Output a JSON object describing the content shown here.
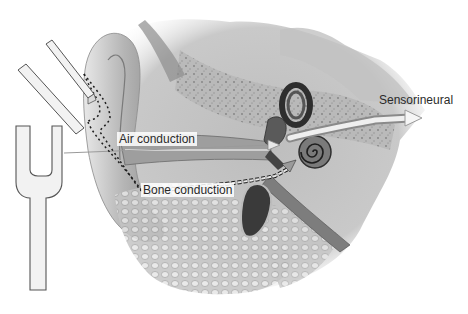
{
  "diagram": {
    "labels": {
      "air": "Air conduction",
      "bone": "Bone conduction",
      "sensorineural": "Sensorineural"
    },
    "elements": [
      {
        "name": "tuning-fork-angled",
        "description": "tuning fork prongs held near ear canal"
      },
      {
        "name": "tuning-fork-upright",
        "description": "tuning fork held vertically, arrow toward ear"
      },
      {
        "name": "outer-ear",
        "description": "auricle / pinna"
      },
      {
        "name": "ear-canal",
        "description": "external auditory canal"
      },
      {
        "name": "middle-ear-ossicles",
        "description": "ossicles near eardrum"
      },
      {
        "name": "semicircular-canals",
        "description": "inner ear vestibular canals"
      },
      {
        "name": "cochlea",
        "description": "spiral cochlea"
      },
      {
        "name": "eustachian-tube",
        "description": "tube descending from middle ear"
      },
      {
        "name": "mastoid-bone",
        "description": "bony cellular structure"
      }
    ],
    "colors": {
      "background": "#ffffff",
      "tissue_light": "#d9d9d9",
      "tissue_mid": "#a8a8a8",
      "tissue_dark": "#3a3a3a",
      "fork_fill": "#f2f2f2",
      "fork_stroke": "#555555",
      "text": "#2a2a2a"
    }
  }
}
